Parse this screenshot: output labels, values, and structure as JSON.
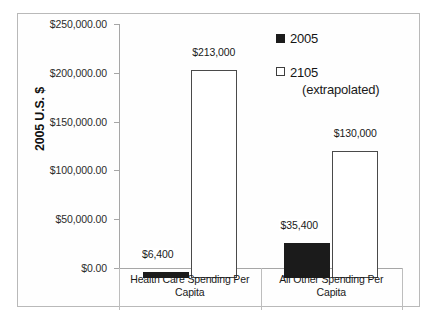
{
  "chart_data": {
    "type": "bar",
    "title": "",
    "xlabel": "",
    "ylabel": "2005 U.S. $",
    "ylim": [
      0,
      250000
    ],
    "grid": false,
    "legend_position": "top-right",
    "categories": [
      "Health Care Spending Per Capita",
      "All Other Spending Per Capita"
    ],
    "series": [
      {
        "name": "2005",
        "color": "#1b1b1b",
        "style": "filled",
        "values": [
          6400,
          35400
        ],
        "labels": [
          "$6,400",
          "$35,400"
        ]
      },
      {
        "name": "2105 (extrapolated)",
        "color": "#ffffff",
        "style": "outline",
        "values": [
          213000,
          130000
        ],
        "labels": [
          "$213,000",
          "$130,000"
        ]
      }
    ],
    "ytick_values": [
      0,
      50000,
      100000,
      150000,
      200000,
      250000
    ],
    "ytick_labels": [
      "$0.00",
      "$50,000.00",
      "$100,000.00",
      "$150,000.00",
      "$200,000.00",
      "$250,000.00"
    ]
  },
  "legend": {
    "entries": [
      {
        "label": "2005",
        "sublabel": ""
      },
      {
        "label": "2105",
        "sublabel": "(extrapolated)"
      }
    ]
  },
  "axis": {
    "y_title": "2005 U.S. $"
  },
  "category_labels": [
    {
      "line1": "Health Care Spending Per",
      "line2": "Capita"
    },
    {
      "line1": "All Other Spending Per",
      "line2": "Capita"
    }
  ]
}
